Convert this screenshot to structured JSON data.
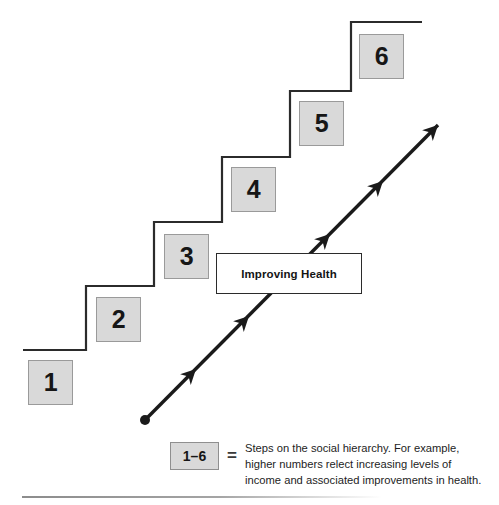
{
  "figure": {
    "type": "staircase-diagram",
    "background_color": "#ffffff",
    "stairs": {
      "line_color": "#2b2b2b",
      "step_count": 6,
      "boxes": [
        {
          "label": "1",
          "x": 28,
          "y": 360,
          "w": 45,
          "h": 45
        },
        {
          "label": "2",
          "x": 96,
          "y": 297,
          "w": 45,
          "h": 45
        },
        {
          "label": "3",
          "x": 164,
          "y": 234,
          "w": 45,
          "h": 45
        },
        {
          "label": "4",
          "x": 231,
          "y": 167,
          "w": 45,
          "h": 45
        },
        {
          "label": "5",
          "x": 299,
          "y": 101,
          "w": 45,
          "h": 45
        },
        {
          "label": "6",
          "x": 359,
          "y": 34,
          "w": 45,
          "h": 45
        }
      ],
      "box_fill_color": "#d9d9d9",
      "box_border_color": "#9a9a9a",
      "polyline": "23,350 86,350 86,286 154,286 154,222 222,222 222,157 290,157 290,91 351,91 351,22 422,22"
    },
    "health_box": {
      "label": "Improving Health",
      "x": 216,
      "y": 253,
      "w": 146,
      "h": 41,
      "fill_color": "#ffffff",
      "border_color": "#2b2b2b"
    },
    "arrow": {
      "color": "#1a1a1a",
      "start_point": {
        "x": 145,
        "y": 420
      },
      "end_point": {
        "x": 438,
        "y": 125
      },
      "start_dot_radius": 5,
      "arrowhead_positions": [
        {
          "x": 196,
          "y": 369
        },
        {
          "x": 249,
          "y": 316
        },
        {
          "x": 330,
          "y": 234
        },
        {
          "x": 383,
          "y": 181
        },
        {
          "x": 438,
          "y": 125
        }
      ]
    }
  },
  "legend": {
    "key_label": "1–6",
    "equals_symbol": "=",
    "description": "Steps on the social hierarchy. For example, higher numbers relect increasing levels of income and associated improvements in health."
  }
}
